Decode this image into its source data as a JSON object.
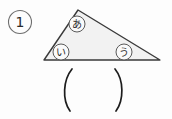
{
  "document": {
    "kind": "math-worksheet-scan",
    "background_color": "#fdfdfd",
    "ink_color": "#2b2b2b"
  },
  "problem": {
    "number_label": "1",
    "number_marker_name": "circled-number-one"
  },
  "figure": {
    "shape": "triangle",
    "fill_color": "#f2f2f2",
    "stroke_color": "#3a3a3a",
    "vertices": {
      "apex": {
        "x": 78,
        "y": 10
      },
      "left": {
        "x": 44,
        "y": 60
      },
      "right": {
        "x": 160,
        "y": 60
      }
    },
    "angle_labels": [
      {
        "id": "apex",
        "text": "あ",
        "cx": 77,
        "cy": 24,
        "r": 8
      },
      {
        "id": "left",
        "text": "い",
        "cx": 61,
        "cy": 52,
        "r": 8
      },
      {
        "id": "right",
        "text": "う",
        "cx": 124,
        "cy": 52,
        "r": 8
      }
    ]
  },
  "answer_blank": {
    "name": "parenthesis-answer-blank",
    "left_paren": "(",
    "right_paren": ")",
    "value": "",
    "left_x": 66,
    "right_x": 120,
    "top_y": 68,
    "bottom_y": 112
  }
}
